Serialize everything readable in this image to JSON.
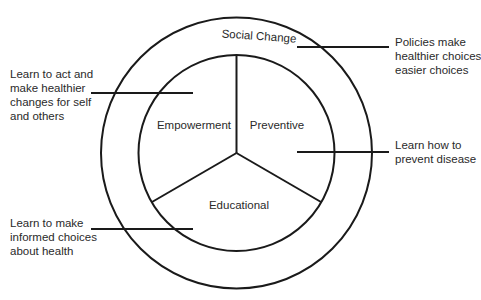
{
  "diagram": {
    "type": "concentric-circle model",
    "colors": {
      "stroke": "#1a1a1a",
      "text": "#2a2a2a",
      "background": "#ffffff"
    },
    "outer_ring": {
      "label": "Social Change"
    },
    "inner_segments": [
      {
        "label": "Empowerment"
      },
      {
        "label": "Preventive"
      },
      {
        "label": "Educational"
      }
    ],
    "annotations": {
      "social_change": {
        "lines": [
          "Policies make",
          "healthier choices",
          "easier choices"
        ]
      },
      "empowerment": {
        "lines": [
          "Learn to act and",
          "make healthier",
          "changes for self",
          "and others"
        ]
      },
      "preventive": {
        "lines": [
          "Learn how to",
          "prevent disease"
        ]
      },
      "educational": {
        "lines": [
          "Learn to make",
          "informed choices",
          "about health"
        ]
      }
    }
  }
}
